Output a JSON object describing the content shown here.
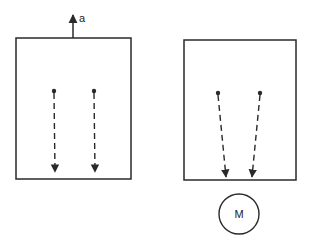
{
  "diagram": {
    "left_panel": {
      "acceleration_label": "a",
      "box": {
        "x": 16,
        "y": 38,
        "w": 115,
        "h": 141
      },
      "accel_arrow": {
        "x": 73,
        "y1": 38,
        "y2": 15
      },
      "particles": [
        {
          "from": [
            54,
            91
          ],
          "to": [
            55,
            172
          ]
        },
        {
          "from": [
            94,
            91
          ],
          "to": [
            95,
            172
          ]
        }
      ]
    },
    "right_panel": {
      "box": {
        "x": 184,
        "y": 40,
        "w": 112,
        "h": 140
      },
      "mass_label": "M",
      "mass": {
        "cx": 239,
        "cy": 214,
        "r": 20
      },
      "particles": [
        {
          "from": [
            218,
            93
          ],
          "to": [
            226,
            177
          ]
        },
        {
          "from": [
            260,
            93
          ],
          "to": [
            252,
            177
          ]
        }
      ]
    },
    "stroke_color": "#2a2a2a"
  }
}
